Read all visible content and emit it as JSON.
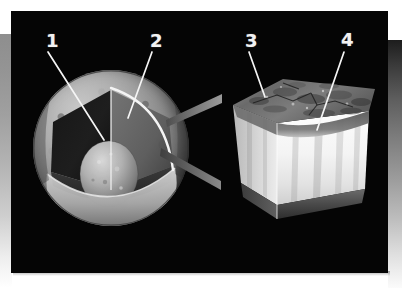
{
  "figure": {
    "background_color": "#050505",
    "frame_color_light": "#ffffff",
    "frame_color_gray": "#8e8e8e",
    "label_color": "#f2f2f2"
  },
  "callouts": [
    {
      "id": "callout-1",
      "label": "1",
      "x": 35,
      "y": 21,
      "target_x": 93,
      "target_y": 129,
      "points_to": "inner-core"
    },
    {
      "id": "callout-2",
      "label": "2",
      "x": 139,
      "y": 21,
      "target_x": 117,
      "target_y": 107,
      "points_to": "mantle"
    },
    {
      "id": "callout-3",
      "label": "3",
      "x": 234,
      "y": 21,
      "target_x": 254,
      "target_y": 86,
      "points_to": "surface-regolith"
    },
    {
      "id": "callout-4",
      "label": "4",
      "x": 330,
      "y": 20,
      "target_x": 306,
      "target_y": 119,
      "points_to": "crust-interior"
    }
  ],
  "left_figure": {
    "name": "cutaway-sphere",
    "parts": [
      {
        "name": "outer-shell",
        "tone": "light-gray-textured"
      },
      {
        "name": "cut-wedge-interior",
        "tone": "dark"
      },
      {
        "name": "inner-core-dome",
        "tone": "medium-gray-granular"
      },
      {
        "name": "equator-rim",
        "tone": "light-gray"
      },
      {
        "name": "cut-arc-highlight",
        "tone": "white"
      }
    ]
  },
  "right_figure": {
    "name": "magnified-crust-block",
    "parts": [
      {
        "name": "top-surface-rough",
        "tone": "dark-mottled"
      },
      {
        "name": "front-face",
        "tone": "bright-white"
      },
      {
        "name": "side-face",
        "tone": "light-gray"
      },
      {
        "name": "bottom-band",
        "tone": "dark-gray"
      },
      {
        "name": "vertical-streaks",
        "tone": "gray-shading"
      }
    ]
  },
  "connector": {
    "name": "magnification-connector",
    "description": "two gray tapered bars linking the sphere cut-face to the magnified block"
  }
}
